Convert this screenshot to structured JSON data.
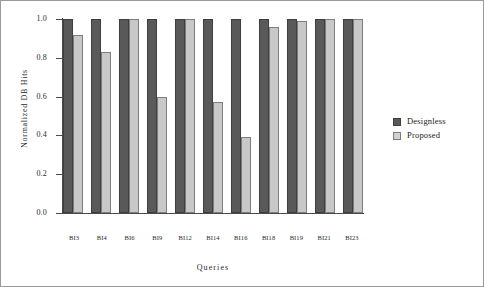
{
  "chart_data": {
    "type": "bar",
    "title": "",
    "xlabel": "Queries",
    "ylabel": "Normalized DB Hits",
    "categories": [
      "BI3",
      "BI4",
      "BI6",
      "BI9",
      "BI12",
      "BI14",
      "BI16",
      "BI18",
      "BI19",
      "BI21",
      "BI23"
    ],
    "series": [
      {
        "name": "Designless",
        "color": "#595959",
        "values": [
          1.0,
          1.0,
          1.0,
          1.0,
          1.0,
          1.0,
          1.0,
          1.0,
          1.0,
          1.0,
          1.0
        ]
      },
      {
        "name": "Proposed",
        "color": "#c8c8c8",
        "values": [
          0.92,
          0.83,
          1.0,
          0.6,
          1.0,
          0.57,
          0.39,
          0.96,
          0.99,
          1.0,
          1.0
        ]
      }
    ],
    "ylim": [
      0.0,
      1.0
    ],
    "ytick_labels": [
      "1.0",
      "0.8",
      "0.6",
      "0.4",
      "0.2",
      "0.0"
    ],
    "ytick_values": [
      1.0,
      0.8,
      0.6,
      0.4,
      0.2,
      0.0
    ],
    "grid": false,
    "legend_position": "right"
  }
}
